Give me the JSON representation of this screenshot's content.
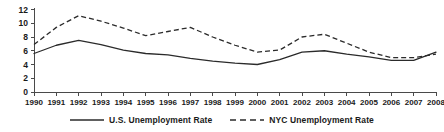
{
  "chart_data": {
    "type": "line",
    "title": "",
    "xlabel": "",
    "ylabel": "",
    "grid": false,
    "legend_position": "bottom-center",
    "xlim": [
      1990,
      2008
    ],
    "ylim": [
      0,
      12
    ],
    "ytick_labels": [
      "0",
      "2",
      "4",
      "6",
      "8",
      "10",
      "12"
    ],
    "ytick_values": [
      0,
      2,
      4,
      6,
      8,
      10,
      12
    ],
    "categories": [
      "1990",
      "1991",
      "1992",
      "1993",
      "1994",
      "1995",
      "1996",
      "1997",
      "1998",
      "1999",
      "2000",
      "2001",
      "2002",
      "2003",
      "2004",
      "2005",
      "2006",
      "2007",
      "2008"
    ],
    "x": [
      1990,
      1991,
      1992,
      1993,
      1994,
      1995,
      1996,
      1997,
      1998,
      1999,
      2000,
      2001,
      2002,
      2003,
      2004,
      2005,
      2006,
      2007,
      2008
    ],
    "series": [
      {
        "name": "U.S. Unemployment Rate",
        "style": "solid",
        "color": "#2b2b2b",
        "values": [
          5.6,
          6.8,
          7.5,
          6.9,
          6.1,
          5.6,
          5.4,
          4.9,
          4.5,
          4.2,
          4.0,
          4.7,
          5.8,
          6.0,
          5.5,
          5.1,
          4.6,
          4.6,
          5.8
        ]
      },
      {
        "name": "NYC Unemployment Rate",
        "style": "dashed",
        "color": "#2b2b2b",
        "values": [
          6.9,
          9.4,
          11.1,
          10.3,
          9.3,
          8.2,
          8.8,
          9.4,
          8.0,
          6.8,
          5.8,
          6.1,
          8.0,
          8.4,
          7.1,
          5.8,
          5.0,
          5.0,
          5.5
        ]
      }
    ]
  },
  "legend": {
    "entries": [
      {
        "label": "U.S. Unemployment Rate",
        "style": "solid"
      },
      {
        "label": "NYC Unemployment Rate",
        "style": "dashed"
      }
    ]
  }
}
